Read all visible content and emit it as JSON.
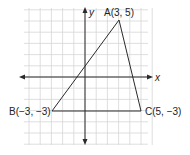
{
  "diagram": {
    "type": "coordinate-plane-triangle",
    "grid": {
      "x_min": -6,
      "x_max": 7,
      "y_min": -6,
      "y_max": 6,
      "unit_px": 11.3
    },
    "axes": {
      "x_label": "x",
      "y_label": "y"
    },
    "points": [
      {
        "name": "A",
        "label": "A(3, 5)",
        "x": 3,
        "y": 5
      },
      {
        "name": "B",
        "label": "B(−3, −3)",
        "x": -3,
        "y": -3
      },
      {
        "name": "C",
        "label": "C(5, −3)",
        "x": 5,
        "y": -3
      }
    ],
    "colors": {
      "grid": "#d4d4d4",
      "lines": "#2a2a2a",
      "background": "#ffffff"
    }
  }
}
